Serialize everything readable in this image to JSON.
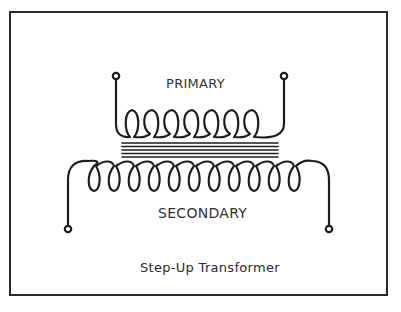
{
  "diagram": {
    "caption": "Step-Up Transformer",
    "primary": {
      "label": "PRIMARY",
      "turns": 7
    },
    "secondary": {
      "label": "SECONDARY",
      "turns": 12
    },
    "core": {
      "lines": 5
    },
    "colors": {
      "ink": "#1e1e1e",
      "background": "#ffffff",
      "frame": "#2a2a2a"
    }
  }
}
